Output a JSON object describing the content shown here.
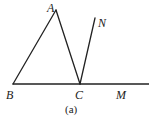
{
  "diagram": {
    "caption": "(a)",
    "points": {
      "A": {
        "label": "A",
        "x": 56,
        "y": 10
      },
      "B": {
        "label": "B",
        "x": 13,
        "y": 84
      },
      "C": {
        "label": "C",
        "x": 80,
        "y": 84
      },
      "N": {
        "label": "N",
        "x": 95,
        "y": 18
      },
      "M": {
        "label": "M",
        "x": 121,
        "y": 84
      }
    },
    "segments": [
      {
        "from": "B",
        "to": "A"
      },
      {
        "from": "A",
        "to": "C"
      },
      {
        "from": "C",
        "to": "N"
      },
      {
        "from": "B",
        "to": "M",
        "note": "line extends to right edge"
      }
    ],
    "colors": {
      "stroke": "#222222",
      "background": "#ffffff"
    }
  }
}
